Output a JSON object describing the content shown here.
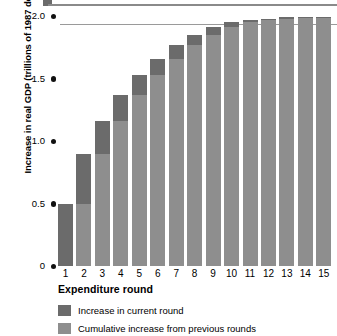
{
  "chart_data": {
    "type": "bar",
    "title": "",
    "subtitle": "",
    "xlabel": "Expenditure round",
    "ylabel": "Increase in real GDP (trillions of 1987 dollars)",
    "categories": [
      "1",
      "2",
      "3",
      "4",
      "5",
      "6",
      "7",
      "8",
      "9",
      "10",
      "11",
      "12",
      "13",
      "14",
      "15"
    ],
    "ylim": [
      0,
      2.0
    ],
    "yticks": [
      "0",
      "0.5",
      "1.0",
      "1.5",
      "2.0"
    ],
    "ytick_values": [
      0,
      0.5,
      1.0,
      1.5,
      2.0
    ],
    "grid": false,
    "legend_position": "bottom-left",
    "stacked": true,
    "annotations": [
      {
        "name": "asymptote-line",
        "value": 2.0,
        "style": "horizontal-rule"
      }
    ],
    "series": [
      {
        "name": "Cumulative increase from previous rounds",
        "color": "#8e8e8e",
        "values": [
          0,
          0.5,
          0.9,
          1.16,
          1.37,
          1.53,
          1.66,
          1.77,
          1.85,
          1.91,
          1.95,
          1.97,
          1.98,
          1.99,
          1.99
        ]
      },
      {
        "name": "Increase in current round",
        "color": "#6b6b6b",
        "values": [
          0.5,
          0.4,
          0.26,
          0.21,
          0.16,
          0.13,
          0.11,
          0.08,
          0.06,
          0.04,
          0.02,
          0.01,
          0.01,
          0.005,
          0.005
        ]
      }
    ],
    "totals": [
      0.5,
      0.9,
      1.16,
      1.37,
      1.53,
      1.66,
      1.77,
      1.85,
      1.91,
      1.95,
      1.97,
      1.98,
      1.99,
      1.99,
      2.0
    ]
  },
  "legend": {
    "items": [
      {
        "label": "Increase in current round",
        "swatch": "cur"
      },
      {
        "label": "Cumulative increase from previous rounds",
        "swatch": "prev"
      }
    ]
  },
  "colors": {
    "current_round": "#6b6b6b",
    "previous_rounds": "#8e8e8e",
    "asymptote": "#9a9a9a",
    "text": "#000000"
  }
}
